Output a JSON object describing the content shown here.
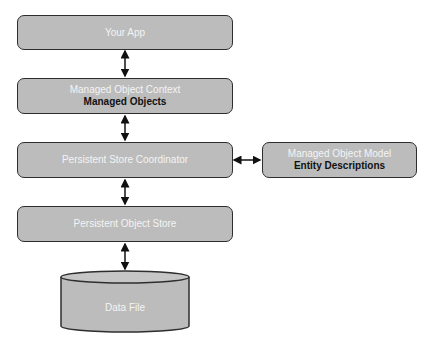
{
  "diagram": {
    "nodes": [
      {
        "id": "your-app",
        "title": "Your App"
      },
      {
        "id": "managed-object-context",
        "title": "Managed Object Context",
        "subtitle": "Managed Objects"
      },
      {
        "id": "persistent-store-coordinator",
        "title": "Persistent Store Coordinator"
      },
      {
        "id": "managed-object-model",
        "title": "Managed Object Model",
        "subtitle": "Entity Descriptions"
      },
      {
        "id": "persistent-object-store",
        "title": "Persistent Object Store"
      },
      {
        "id": "data-file",
        "title": "Data File",
        "shape": "cylinder"
      }
    ],
    "edges": [
      {
        "from": "your-app",
        "to": "managed-object-context",
        "type": "bidirectional"
      },
      {
        "from": "managed-object-context",
        "to": "persistent-store-coordinator",
        "type": "bidirectional"
      },
      {
        "from": "persistent-store-coordinator",
        "to": "managed-object-model",
        "type": "bidirectional"
      },
      {
        "from": "persistent-store-coordinator",
        "to": "persistent-object-store",
        "type": "bidirectional"
      },
      {
        "from": "persistent-object-store",
        "to": "data-file",
        "type": "bidirectional"
      }
    ],
    "colors": {
      "box_fill": "#bcbcbc",
      "border": "#2e2e2e",
      "title_text": "#f4f4f4",
      "subtitle_text": "#111111"
    }
  }
}
